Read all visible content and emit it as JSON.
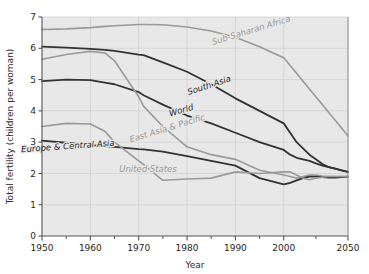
{
  "chart_data": {
    "type": "line",
    "title": "",
    "xlabel": "Year",
    "ylabel": "Total fertility (children per woman)",
    "xlim": [
      1950,
      2050
    ],
    "ylim": [
      0,
      7
    ],
    "grid": true,
    "legend_position": "inline-labels",
    "plot_background": "#e8e8e8",
    "xticks": [
      1950,
      1960,
      1970,
      1980,
      1990,
      2000,
      2050
    ],
    "xtick_labels": [
      "1950",
      "1960",
      "1970",
      "1980",
      "1990",
      "2000",
      "2050"
    ],
    "yticks": [
      0,
      1,
      2,
      3,
      4,
      5,
      6,
      7
    ],
    "ytick_labels": [
      "0",
      "1",
      "2",
      "3",
      "4",
      "5",
      "6",
      "7"
    ],
    "x": [
      1950,
      1955,
      1960,
      1963,
      1965,
      1970,
      1971,
      1975,
      1980,
      1985,
      1990,
      1995,
      2000,
      2005,
      2010,
      2015,
      2020,
      2025,
      2030,
      2035,
      2040,
      2045,
      2050
    ],
    "series": [
      {
        "name": "Sub-Saharan Africa",
        "color": "#9a9a9a",
        "label_color": "#9a9a9a",
        "width": 1.6,
        "label_x": 252,
        "label_y": 33,
        "label_rotate": -17,
        "values": [
          6.6,
          6.62,
          6.66,
          6.7,
          6.72,
          6.76,
          6.76,
          6.75,
          6.68,
          6.55,
          6.35,
          6.05,
          5.7,
          5.45,
          5.2,
          4.95,
          4.7,
          4.45,
          4.2,
          3.95,
          3.7,
          3.45,
          3.2
        ]
      },
      {
        "name": "South Asia",
        "color": "#333333",
        "label_color": "#2a2a2a",
        "width": 1.8,
        "label_x": 210,
        "label_y": 88,
        "label_rotate": -18,
        "values": [
          6.05,
          6.02,
          5.98,
          5.95,
          5.92,
          5.8,
          5.78,
          5.55,
          5.25,
          4.85,
          4.4,
          4.0,
          3.6,
          3.3,
          3.0,
          2.8,
          2.6,
          2.45,
          2.3,
          2.2,
          2.15,
          2.1,
          2.05
        ]
      },
      {
        "name": "World",
        "color": "#333333",
        "label_color": "#2a2a2a",
        "width": 1.8,
        "label_x": 182,
        "label_y": 113,
        "label_rotate": -16,
        "values": [
          4.95,
          5.0,
          4.98,
          4.9,
          4.85,
          4.6,
          4.5,
          4.2,
          3.85,
          3.6,
          3.3,
          3.0,
          2.75,
          2.6,
          2.5,
          2.45,
          2.4,
          2.32,
          2.25,
          2.2,
          2.15,
          2.1,
          2.05
        ]
      },
      {
        "name": "East Asia & Pacific",
        "color": "#9a9a9a",
        "label_color": "#9a9a9a",
        "width": 1.6,
        "label_x": 168,
        "label_y": 131,
        "label_rotate": -17,
        "values": [
          5.65,
          5.8,
          5.9,
          5.85,
          5.6,
          4.45,
          4.15,
          3.5,
          2.85,
          2.6,
          2.45,
          2.1,
          1.95,
          1.9,
          1.85,
          1.9,
          1.95,
          1.95,
          1.92,
          1.9,
          1.9,
          1.9,
          1.9
        ]
      },
      {
        "name": "Europe & Central Asia",
        "color": "#333333",
        "label_color": "#2a2a2a",
        "width": 1.8,
        "label_x": 68,
        "label_y": 149,
        "label_rotate": -4,
        "values": [
          3.05,
          2.98,
          2.9,
          2.87,
          2.85,
          2.78,
          2.77,
          2.7,
          2.55,
          2.4,
          2.25,
          1.85,
          1.65,
          1.7,
          1.78,
          1.85,
          1.9,
          1.9,
          1.88,
          1.87,
          1.87,
          1.88,
          1.9
        ]
      },
      {
        "name": "United States",
        "color": "#9a9a9a",
        "label_color": "#9a9a9a",
        "width": 1.6,
        "label_x": 148,
        "label_y": 172,
        "label_rotate": 0,
        "values": [
          3.5,
          3.6,
          3.58,
          3.35,
          3.0,
          2.4,
          2.28,
          1.78,
          1.82,
          1.85,
          2.05,
          2.0,
          2.05,
          2.05,
          1.95,
          1.85,
          1.8,
          1.85,
          1.88,
          1.9,
          1.9,
          1.9,
          1.9
        ]
      }
    ]
  }
}
